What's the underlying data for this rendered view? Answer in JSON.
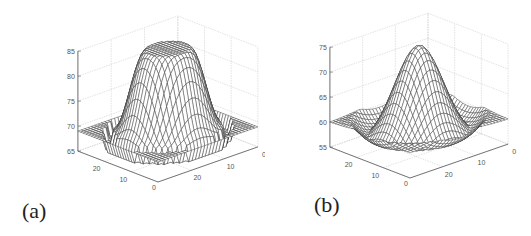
{
  "figure": {
    "captions": [
      "(a)",
      "(b)"
    ]
  },
  "chart_data": [
    {
      "type": "surface3d",
      "panel_label": "(a)",
      "title": "",
      "xlabel": "",
      "ylabel": "",
      "zlabel": "",
      "zlim": [
        65,
        85
      ],
      "z_ticks": [
        "65",
        "70",
        "75",
        "80",
        "85"
      ],
      "x_ticks": [
        "0",
        "10",
        "20"
      ],
      "y_ticks": [
        "0",
        "10",
        "20"
      ],
      "x_range": [
        0,
        30
      ],
      "y_range": [
        0,
        30
      ],
      "grid": true,
      "shape": "flat-topped dome (plateau) with flat base at ~69, dips to ~66 at edges near base",
      "peak_value": 85,
      "base_value": 69,
      "min_value": 66,
      "mesh_color": "#333333",
      "geometry": {
        "origin": [
          158,
          182
        ],
        "ux": [
          3.33,
          -1.17
        ],
        "uy": [
          -2.67,
          -1.03
        ],
        "z_axis_x": 78,
        "z_top_y": 43,
        "z_bottom_y": 143
      }
    },
    {
      "type": "surface3d",
      "panel_label": "(b)",
      "title": "",
      "xlabel": "",
      "ylabel": "",
      "zlabel": "",
      "zlim": [
        55,
        75
      ],
      "z_ticks": [
        "55",
        "60",
        "65",
        "70",
        "75"
      ],
      "x_ticks": [
        "0",
        "10",
        "20"
      ],
      "y_ticks": [
        "0",
        "10",
        "20"
      ],
      "x_range": [
        0,
        30
      ],
      "y_range": [
        0,
        30
      ],
      "grid": true,
      "shape": "smooth gaussian-like hill, edges around 60, peak ~75, lowest region ~55 near front",
      "peak_value": 75,
      "base_value": 60,
      "min_value": 55,
      "mesh_color": "#333333",
      "geometry": {
        "origin": [
          145,
          178
        ],
        "ux": [
          3.27,
          -1.13
        ],
        "uy": [
          -2.67,
          -1.03
        ],
        "z_axis_x": 66,
        "z_top_y": 41,
        "z_bottom_y": 141
      }
    }
  ]
}
